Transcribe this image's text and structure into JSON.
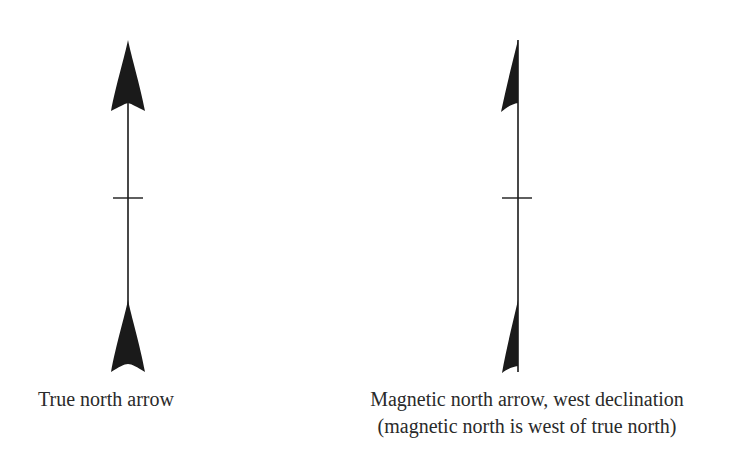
{
  "diagram": {
    "colors": {
      "ink": "#1a1a1a",
      "text": "#2a2a2a",
      "background": "#ffffff"
    },
    "arrows": [
      {
        "id": "true-north",
        "caption": "True north arrow",
        "head": "full",
        "tail": "full"
      },
      {
        "id": "magnetic-north",
        "caption_lines": [
          "Magnetic north arrow, west declination",
          "(magnetic north is west of true north)"
        ],
        "head": "half-left",
        "tail": "half-left",
        "declination": "west"
      }
    ]
  }
}
